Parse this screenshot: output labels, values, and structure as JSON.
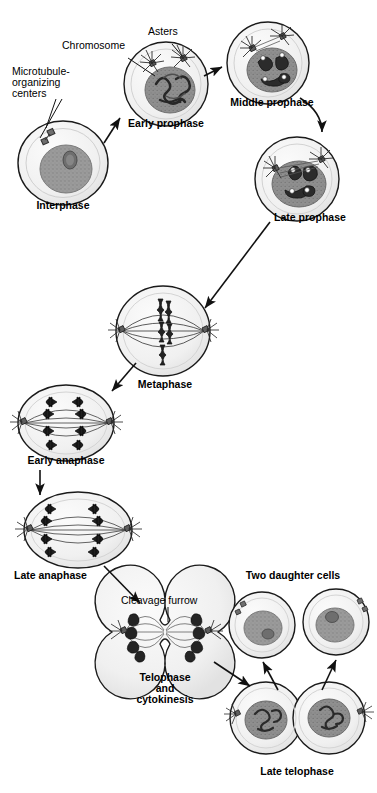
{
  "diagram": {
    "type": "biology-cell-cycle-diagram",
    "palette": {
      "outline": "#1a1a1a",
      "cytoplasm": "#f2f2f2",
      "cytoplasm_edge": "#d8d8d8",
      "nucleus": "#9a9a9a",
      "nucleus_dark": "#7d7d7d",
      "nucleolus": "#6b6b6b",
      "chromosome": "#2b2b2b",
      "mtoc": "#555555",
      "spindle": "#4a4a4a",
      "background": "#ffffff"
    }
  },
  "callouts": {
    "mtoc": "Microtubule-\norganizing\ncenters",
    "chromosome": "Chromosome",
    "asters": "Asters",
    "cleavage_furrow": "Cleavage furrow",
    "two_daughter_cells": "Two daughter cells"
  },
  "stages": [
    {
      "id": "interphase",
      "label": "Interphase",
      "label_x": 63,
      "label_y": 207,
      "cx": 63,
      "cy": 163,
      "order": 1
    },
    {
      "id": "early-prophase",
      "label": "Early prophase",
      "label_x": 166,
      "label_y": 124,
      "cx": 166,
      "cy": 84,
      "order": 2
    },
    {
      "id": "middle-prophase",
      "label": "Middle prophase",
      "label_x": 272,
      "label_y": 103,
      "cx": 268,
      "cy": 63,
      "order": 3
    },
    {
      "id": "late-prophase",
      "label": "Late prophase",
      "label_x": 309,
      "label_y": 218,
      "cx": 297,
      "cy": 179,
      "order": 4
    },
    {
      "id": "metaphase",
      "label": "Metaphase",
      "label_x": 165,
      "label_y": 383,
      "cx": 163,
      "cy": 331,
      "order": 5
    },
    {
      "id": "early-anaphase",
      "label": "Early anaphase",
      "label_x": 66,
      "label_y": 460,
      "cx": 66,
      "cy": 423,
      "order": 6
    },
    {
      "id": "late-anaphase",
      "label": "Late anaphase",
      "label_x": 47,
      "label_y": 574,
      "cx": 78,
      "cy": 530,
      "order": 7
    },
    {
      "id": "telophase",
      "label": "Telophase\nand\ncytokinesis",
      "label_x": 165,
      "label_y": 679,
      "cx": 165,
      "cy": 632,
      "order": 8
    },
    {
      "id": "late-telophase",
      "label": "Late telophase",
      "label_x": 297,
      "label_y": 772,
      "cx": 297,
      "cy": 718,
      "order": 9
    },
    {
      "id": "daughter-cells",
      "label": "Two daughter cells",
      "label_x": 293,
      "label_y": 586,
      "cx": 293,
      "cy": 625,
      "order": 10
    }
  ]
}
